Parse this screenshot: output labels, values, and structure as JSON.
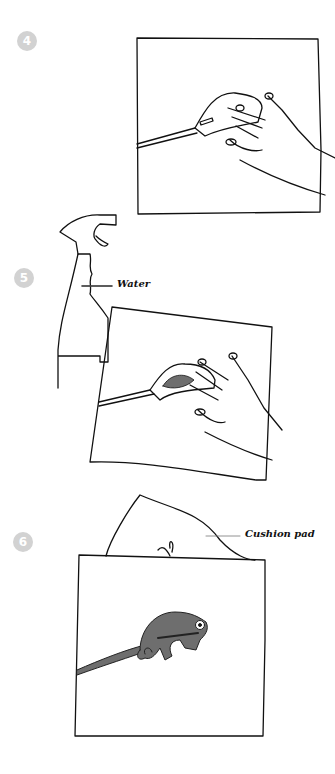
{
  "steps": [
    {
      "number": "4",
      "description": "Sweep tool along mounted paper, hand holding surface"
    },
    {
      "number": "5",
      "description": "Spray bottle with water; hand pressing mounted item",
      "label": "Water"
    },
    {
      "number": "6",
      "description": "Cushion pad behind finished chameleon mount",
      "label": "Cushion pad"
    }
  ],
  "colors": {
    "line": "#111111",
    "badge": "#d2d2d2",
    "chameleon": "#6e6e6e",
    "background": "#ffffff"
  }
}
